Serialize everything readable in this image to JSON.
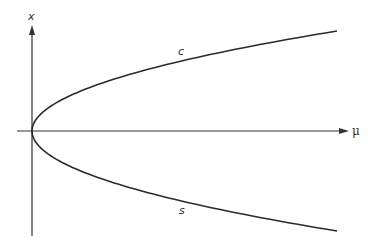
{
  "diagram": {
    "type": "bifurcation-diagram",
    "axes": {
      "horizontal_label": "μ",
      "vertical_label": "x"
    },
    "branches": [
      {
        "name": "upper",
        "label": "c",
        "relation": "x = +sqrt(mu)"
      },
      {
        "name": "lower",
        "label": "s",
        "relation": "x = -sqrt(mu)"
      }
    ],
    "colors": {
      "line": "#2a2a2a",
      "axis": "#333333",
      "background": "#ffffff"
    }
  }
}
